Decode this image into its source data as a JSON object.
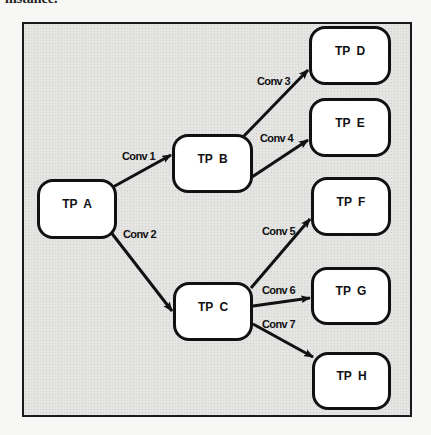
{
  "caption_fragment": "instance.",
  "diagram": {
    "nodes": [
      {
        "id": "A",
        "label": "TP A"
      },
      {
        "id": "B",
        "label": "TP B"
      },
      {
        "id": "C",
        "label": "TP C"
      },
      {
        "id": "D",
        "label": "TP D"
      },
      {
        "id": "E",
        "label": "TP E"
      },
      {
        "id": "F",
        "label": "TP F"
      },
      {
        "id": "G",
        "label": "TP G"
      },
      {
        "id": "H",
        "label": "TP H"
      }
    ],
    "edges": [
      {
        "from": "A",
        "to": "B",
        "label": "Conv 1"
      },
      {
        "from": "A",
        "to": "C",
        "label": "Conv 2"
      },
      {
        "from": "B",
        "to": "D",
        "label": "Conv 3"
      },
      {
        "from": "B",
        "to": "E",
        "label": "Conv 4"
      },
      {
        "from": "C",
        "to": "F",
        "label": "Conv 5"
      },
      {
        "from": "C",
        "to": "G",
        "label": "Conv 6"
      },
      {
        "from": "C",
        "to": "H",
        "label": "Conv 7"
      }
    ]
  }
}
